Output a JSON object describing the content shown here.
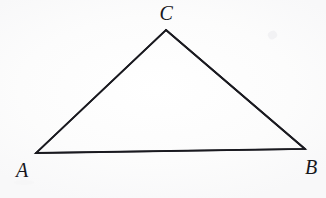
{
  "figure": {
    "kind": "geometry-diagram",
    "shape": "triangle",
    "background_color": "#fdfdfd",
    "stroke_color": "#1a1a20",
    "stroke_width": 1.8,
    "canvas": {
      "width": 326,
      "height": 198
    },
    "vertices": [
      {
        "id": "A",
        "label": "A",
        "x": 36,
        "y": 153,
        "label_x": 22,
        "label_y": 170,
        "label_position": "below-left"
      },
      {
        "id": "B",
        "label": "B",
        "x": 305,
        "y": 149,
        "label_x": 311,
        "label_y": 167,
        "label_position": "below-right"
      },
      {
        "id": "C",
        "label": "C",
        "x": 166,
        "y": 30,
        "label_x": 166,
        "label_y": 13,
        "label_position": "above"
      }
    ],
    "edges": [
      {
        "id": "AC",
        "from": "A",
        "to": "C"
      },
      {
        "id": "CB",
        "from": "C",
        "to": "B"
      },
      {
        "id": "AB",
        "from": "A",
        "to": "B"
      }
    ],
    "polygon_points": "36,153 166,30 305,149",
    "artifacts": [
      {
        "id": "smudge-upper-right",
        "x": 268,
        "y": 31,
        "color": "#f2f2f4"
      },
      {
        "id": "smudge-lower-left",
        "x": 14,
        "y": 180,
        "color": "#f6f6f7"
      }
    ]
  }
}
